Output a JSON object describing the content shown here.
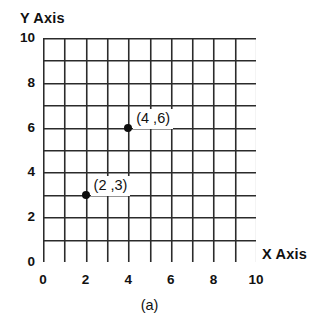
{
  "figure": {
    "caption": "(a)",
    "y_axis_title": "Y Axis",
    "x_axis_title": "X Axis"
  },
  "chart_data": {
    "type": "scatter",
    "title": "",
    "caption": "(a)",
    "xlabel": "X Axis",
    "ylabel": "Y Axis",
    "xlim": [
      0,
      10
    ],
    "ylim": [
      0,
      10
    ],
    "grid": true,
    "grid_step": 1,
    "legend": "none",
    "x_ticks": [
      0,
      2,
      4,
      6,
      8,
      10
    ],
    "x_tick_labels": [
      "0",
      "2",
      "4",
      "6",
      "8",
      "10"
    ],
    "y_ticks": [
      0,
      2,
      4,
      6,
      8,
      10
    ],
    "y_tick_labels": [
      "0",
      "2",
      "4",
      "6",
      "8",
      "10"
    ],
    "points": [
      {
        "x": 4,
        "y": 6,
        "label": "(4 ,6)"
      },
      {
        "x": 2,
        "y": 3,
        "label": "(2 ,3)"
      }
    ],
    "colors": {
      "grid_line": "#2b2b2b",
      "point": "#0d0d0d",
      "text": "#111111",
      "background": "#ffffff"
    }
  }
}
